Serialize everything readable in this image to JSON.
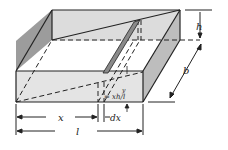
{
  "diagram": {
    "type": "geometry",
    "labels": {
      "h": "h",
      "b": "b",
      "x": "x",
      "dx": "dx",
      "l": "l",
      "y": "y",
      "y_expr": "= xh/l"
    },
    "colors": {
      "line": "#222222",
      "face_light": "#e6e6e6",
      "face_mid": "#cfcfcf",
      "face_dark": "#9a9a9a",
      "background": "#ffffff"
    }
  }
}
